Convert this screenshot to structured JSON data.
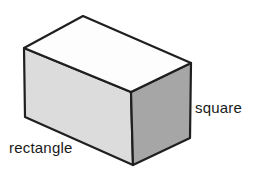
{
  "diagram": {
    "labels": {
      "front_face": "rectangle",
      "side_face": "square"
    },
    "colors": {
      "background": "#ffffff",
      "top_face": "#fdfdfd",
      "front_face": "#dcdcdc",
      "side_face": "#a6a6a6",
      "edge": "#1f1f1f",
      "text": "#1a1a1a"
    }
  }
}
